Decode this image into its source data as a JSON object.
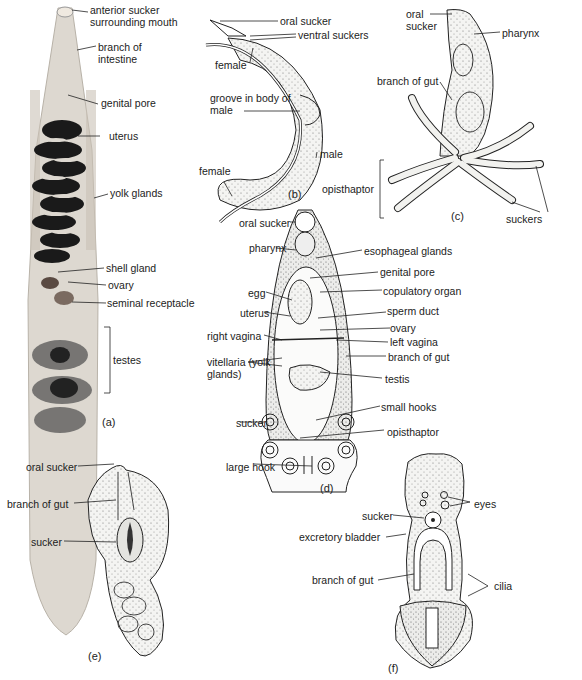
{
  "panels": {
    "a": {
      "caption": "(a)",
      "labels": {
        "anterior_sucker": "anterior sucker surrounding mouth",
        "branch_intestine": "branch of intestine",
        "genital_pore": "genital pore",
        "uterus": "uterus",
        "yolk_glands": "yolk glands",
        "shell_gland": "shell gland",
        "ovary": "ovary",
        "seminal_receptacle": "seminal receptacle",
        "testes": "testes"
      }
    },
    "b": {
      "caption": "(b)",
      "labels": {
        "oral_sucker": "oral sucker",
        "ventral_suckers": "ventral suckers",
        "female_top": "female",
        "groove": "groove in body of male",
        "male": "male",
        "female_bottom": "female"
      }
    },
    "c": {
      "caption": "(c)",
      "labels": {
        "oral_sucker": "oral sucker",
        "pharynx": "pharynx",
        "branch_gut": "branch of gut",
        "opisthaptor": "opisthaptor",
        "suckers": "suckers"
      }
    },
    "d": {
      "caption": "(d)",
      "labels": {
        "oral_sucker": "oral sucker",
        "pharynx": "pharynx",
        "esophageal_glands": "esophageal glands",
        "genital_pore": "genital pore",
        "egg": "egg",
        "copulatory_organ": "copulatory organ",
        "uterus": "uterus",
        "sperm_duct": "sperm duct",
        "ovary": "ovary",
        "right_vagina": "right vagina",
        "left_vagina": "left vagina",
        "vitellaria": "vitellaria (yolk glands)",
        "branch_gut": "branch of gut",
        "testis": "testis",
        "small_hooks": "small hooks",
        "sucker": "sucker",
        "opisthaptor": "opisthaptor",
        "large_hook": "large hook"
      }
    },
    "e": {
      "caption": "(e)",
      "labels": {
        "oral_sucker": "oral sucker",
        "branch_gut": "branch of gut",
        "sucker": "sucker"
      }
    },
    "f": {
      "caption": "(f)",
      "labels": {
        "eyes": "eyes",
        "sucker": "sucker",
        "excretory_bladder": "excretory bladder",
        "branch_gut": "branch of gut",
        "cilia": "cilia"
      }
    }
  }
}
